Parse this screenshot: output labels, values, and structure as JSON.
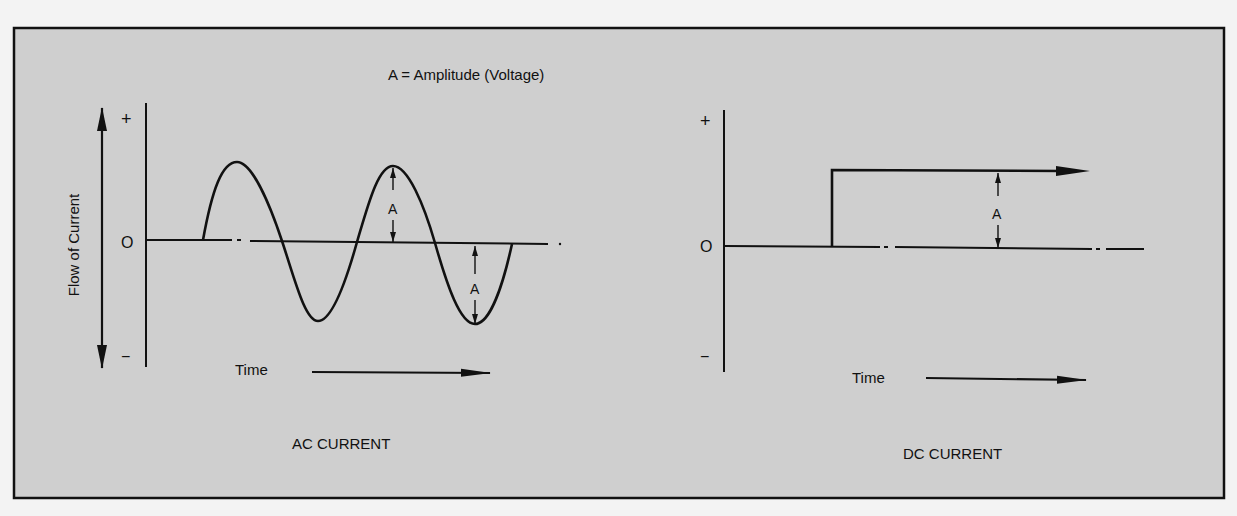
{
  "figure": {
    "legend": "A = Amplitude (Voltage)",
    "background_color": "#cfcfcf",
    "border_color": "#111111",
    "ink_color": "#111111"
  },
  "ac_panel": {
    "title": "AC CURRENT",
    "y_axis_label": "Flow of Current",
    "plus_label": "+",
    "zero_label": "O",
    "minus_label": "−",
    "time_label": "Time",
    "amplitude_label_1": "A",
    "amplitude_label_2": "A",
    "waveform": "sine"
  },
  "dc_panel": {
    "title": "DC CURRENT",
    "plus_label": "+",
    "zero_label": "O",
    "minus_label": "−",
    "time_label": "Time",
    "amplitude_label": "A",
    "waveform": "step"
  }
}
